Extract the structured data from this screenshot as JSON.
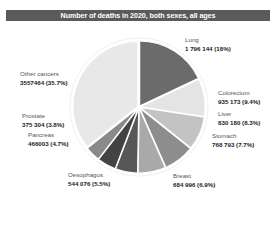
{
  "chart_data": {
    "type": "pie",
    "title": "Number of deaths in 2020, both sexes, all ages",
    "start_angle": "12 o'clock",
    "direction": "clockwise",
    "slices": [
      {
        "label": "Lung",
        "value": 1796144,
        "value_text": "1 796 144 (18%)",
        "percent": 18.0,
        "color": "#6b6b6b"
      },
      {
        "label": "Colorectum",
        "value": 935173,
        "value_text": "935 173 (9.4%)",
        "percent": 9.4,
        "color": "#e4e4e4"
      },
      {
        "label": "Liver",
        "value": 830180,
        "value_text": "830 180 (8.3%)",
        "percent": 8.3,
        "color": "#c3c3c3"
      },
      {
        "label": "Stomach",
        "value": 768793,
        "value_text": "768 793 (7.7%)",
        "percent": 7.7,
        "color": "#8d8d8d"
      },
      {
        "label": "Breast",
        "value": 684996,
        "value_text": "684 996 (6.9%)",
        "percent": 6.9,
        "color": "#a9a9a9"
      },
      {
        "label": "Oesophagus",
        "value": 544076,
        "value_text": "544 076 (5.5%)",
        "percent": 5.5,
        "color": "#575757"
      },
      {
        "label": "Pancreas",
        "value": 466003,
        "value_text": "466003 (4.7%)",
        "percent": 4.7,
        "color": "#434343"
      },
      {
        "label": "Prostate",
        "value": 375304,
        "value_text": "375 304 (3.8%)",
        "percent": 3.8,
        "color": "#8a8a8a"
      },
      {
        "label": "Other cancers",
        "value": 3557464,
        "value_text": "3557464 (35.7%)",
        "percent": 35.7,
        "color": "#e8e8e8"
      }
    ]
  },
  "title_bar_color": "#5a5a5a",
  "labels": [
    {
      "name": "Lung",
      "value": "1 796 144 (18%)",
      "x": 185,
      "y": 36
    },
    {
      "name": "Colorectum",
      "value": "935 173 (9.4%)",
      "x": 218,
      "y": 89
    },
    {
      "name": "Liver",
      "value": "830 180 (8.3%)",
      "x": 218,
      "y": 110
    },
    {
      "name": "Stomach",
      "value": "768 793 (7.7%)",
      "x": 212,
      "y": 132
    },
    {
      "name": "Breast",
      "value": "684 996 (6.9%)",
      "x": 173,
      "y": 172
    },
    {
      "name": "Oesophagus",
      "value": "544 076 (5.5%)",
      "x": 68,
      "y": 171
    },
    {
      "name": "Pancreas",
      "value": "466003 (4.7%)",
      "x": 28,
      "y": 131
    },
    {
      "name": "Prostate",
      "value": "375 304 (3.8%)",
      "x": 22,
      "y": 112
    },
    {
      "name": "Other cancers",
      "value": "3557464 (35.7%)",
      "x": 20,
      "y": 70
    }
  ]
}
